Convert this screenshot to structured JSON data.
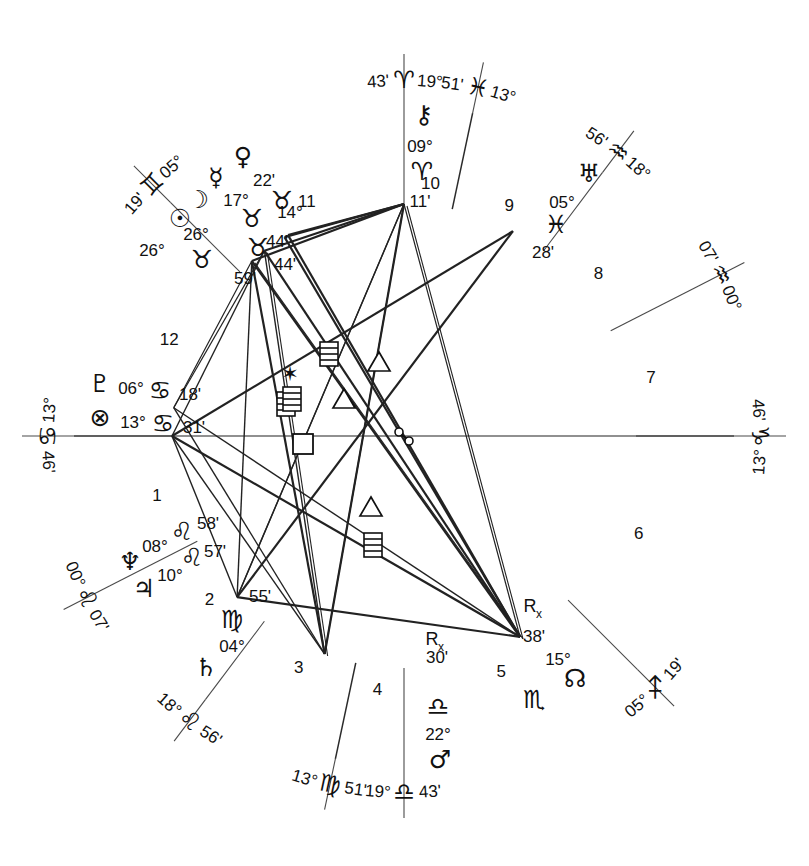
{
  "chart_data": {
    "type": "wheel",
    "house_system": "quadrant",
    "rings": {
      "outer_radius": 382,
      "zodiac_inner_radius": 330,
      "house_ring_radius": 268,
      "inner_radius": 232
    },
    "cusps": [
      {
        "house": 1,
        "deg": "13°",
        "sign": "♋",
        "min": "46'",
        "sign_name": "Cancer",
        "angle": 180,
        "label": "Ascendant"
      },
      {
        "house": 2,
        "deg": "00°",
        "sign": "♌",
        "min": "07'",
        "sign_name": "Leo",
        "angle": 207,
        "label": ""
      },
      {
        "house": 3,
        "deg": "18°",
        "sign": "♌",
        "min": "56'",
        "sign_name": "Leo",
        "angle": 233,
        "label": ""
      },
      {
        "house": 4,
        "deg": "13°",
        "sign": "♍",
        "min": "51'",
        "sign_name": "Virgo",
        "angle": 258,
        "label": ""
      },
      {
        "house": 5,
        "deg": "19°",
        "sign": "♎",
        "min": "43'",
        "sign_name": "Libra",
        "angle": 270,
        "label": "IC"
      },
      {
        "house": 6,
        "deg": "05°",
        "sign": "♐",
        "min": "19'",
        "sign_name": "Sagittarius",
        "angle": 315,
        "label": ""
      },
      {
        "house": 7,
        "deg": "13°",
        "sign": "♑",
        "min": "46'",
        "sign_name": "Capricorn",
        "angle": 0,
        "label": "Descendant"
      },
      {
        "house": 8,
        "deg": "00°",
        "sign": "♒",
        "min": "07'",
        "sign_name": "Aquarius",
        "angle": 27,
        "label": ""
      },
      {
        "house": 9,
        "deg": "18°",
        "sign": "♒",
        "min": "56'",
        "sign_name": "Aquarius",
        "angle": 53,
        "label": ""
      },
      {
        "house": 10,
        "deg": "13°",
        "sign": "♓",
        "min": "51'",
        "sign_name": "Pisces",
        "angle": 78,
        "label": ""
      },
      {
        "house": 11,
        "deg": "19°",
        "sign": "♈",
        "min": "43'",
        "sign_name": "Aries",
        "angle": 90,
        "label": "MC"
      },
      {
        "house": 12,
        "deg": "05°",
        "sign": "♊",
        "min": "19'",
        "sign_name": "Gemini",
        "angle": 135,
        "label": ""
      }
    ],
    "house_numbers": [
      "1",
      "2",
      "3",
      "4",
      "5",
      "6",
      "7",
      "8",
      "9",
      "10",
      "11",
      "12"
    ],
    "planets": [
      {
        "name": "Sun",
        "glyph": "☉",
        "deg": "26°",
        "sign": "♉",
        "min": "59'",
        "sign_name": "Taurus",
        "retrograde": false,
        "house": 11
      },
      {
        "name": "Moon",
        "glyph": "☽",
        "deg": "26°",
        "sign": "♉",
        "min": "44'",
        "sign_name": "Taurus",
        "retrograde": false,
        "house": 11
      },
      {
        "name": "Mercury",
        "glyph": "☿",
        "deg": "17°",
        "sign": "♉",
        "min": "44'",
        "sign_name": "Taurus",
        "retrograde": false,
        "house": 11
      },
      {
        "name": "Venus",
        "glyph": "♀",
        "deg": "14°",
        "sign": "♉",
        "min": "22'",
        "sign_name": "Taurus",
        "retrograde": false,
        "house": 11
      },
      {
        "name": "Chiron",
        "glyph": "⚷",
        "deg": "09°",
        "sign": "♈",
        "min": "11'",
        "sign_name": "Aries",
        "retrograde": false,
        "house": 10
      },
      {
        "name": "Uranus",
        "glyph": "♅",
        "deg": "05°",
        "sign": "♓",
        "min": "28'",
        "sign_name": "Pisces",
        "retrograde": false,
        "house": 9
      },
      {
        "name": "Mars",
        "glyph": "♂",
        "deg": "22°",
        "sign": "♎",
        "min": "30'",
        "sign_name": "Libra",
        "retrograde": true,
        "house": 4
      },
      {
        "name": "South Node",
        "glyph": "☊",
        "deg": "15°",
        "sign": "♏",
        "min": "38'",
        "sign_name": "Scorpio",
        "retrograde": true,
        "house": 5
      },
      {
        "name": "Saturn",
        "glyph": "♄",
        "deg": "04°",
        "sign": "♍",
        "min": "55'",
        "sign_name": "Virgo",
        "retrograde": false,
        "house": 3
      },
      {
        "name": "Jupiter",
        "glyph": "♃",
        "deg": "10°",
        "sign": "♌",
        "min": "57'",
        "sign_name": "Leo",
        "retrograde": false,
        "house": 2
      },
      {
        "name": "Neptune",
        "glyph": "♆",
        "deg": "08°",
        "sign": "♌",
        "min": "58'",
        "sign_name": "Leo",
        "retrograde": false,
        "house": 2
      },
      {
        "name": "Pluto",
        "glyph": "♇",
        "deg": "06°",
        "sign": "♋",
        "min": "18'",
        "sign_name": "Cancer",
        "retrograde": false,
        "house": 12
      },
      {
        "name": "Part of Fortune",
        "glyph": "⊗",
        "deg": "13°",
        "sign": "♋",
        "min": "31'",
        "sign_name": "Cancer",
        "retrograde": false,
        "house": 12
      }
    ],
    "retrograde_marker": {
      "letter": "R",
      "sub": "x"
    },
    "aspect_glyphs": [
      {
        "type": "sextile",
        "glyph": "✶",
        "x": 290,
        "y": 372
      },
      {
        "type": "quincunx",
        "glyph": "≡",
        "x": 329,
        "y": 354
      },
      {
        "type": "trine",
        "glyph": "△",
        "x": 379,
        "y": 363
      },
      {
        "type": "trine",
        "glyph": "△",
        "x": 344,
        "y": 400
      },
      {
        "type": "quincunx",
        "glyph": "≡",
        "x": 286,
        "y": 404
      },
      {
        "type": "quincunx",
        "glyph": "≡",
        "x": 292,
        "y": 399
      },
      {
        "type": "square",
        "glyph": "□",
        "x": 303,
        "y": 444
      },
      {
        "type": "opposition",
        "glyph": "☍",
        "x": 404,
        "y": 436
      },
      {
        "type": "trine",
        "glyph": "△",
        "x": 371,
        "y": 508
      },
      {
        "type": "quincunx",
        "glyph": "≡",
        "x": 373,
        "y": 545
      }
    ],
    "aspect_legend": {
      "sextile": "✶",
      "square": "□",
      "trine": "△",
      "opposition": "☍",
      "quincunx": "≡"
    }
  }
}
